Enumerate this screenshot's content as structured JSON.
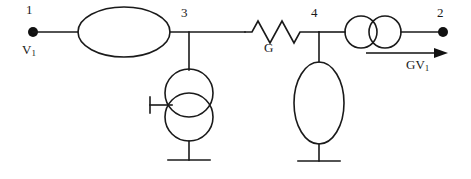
{
  "figure": {
    "type": "circuit-schematic",
    "title": "",
    "background_color": "#ffffff",
    "line_color": "#1a1a1a"
  },
  "nodes": {
    "node_1": "1",
    "node_2": "2",
    "node_3": "3",
    "node_4": "4"
  },
  "labels": {
    "input_voltage": "V",
    "input_voltage_subscript": "1",
    "conductance": "G",
    "dependent_source": "GV",
    "dependent_source_subscript": "1"
  },
  "components": [
    {
      "id": "source-left",
      "name": "left-ellipse-source",
      "symbol": "ellipse-horizontal",
      "between": [
        "1",
        "3"
      ]
    },
    {
      "id": "shunt-3",
      "name": "node-3-shunt-double-circle-source",
      "symbol": "double-circle-vertical-with-stub",
      "between": [
        "3",
        "ground"
      ]
    },
    {
      "id": "resistor-g",
      "name": "conductance-g",
      "symbol": "zigzag-resistor",
      "label": "G",
      "between": [
        "3",
        "4"
      ]
    },
    {
      "id": "shunt-4",
      "name": "node-4-shunt-ellipse",
      "symbol": "ellipse-vertical",
      "between": [
        "4",
        "ground"
      ]
    },
    {
      "id": "source-right",
      "name": "dependent-current-source",
      "symbol": "double-circle-horizontal",
      "label": "GV1",
      "between": [
        "4",
        "2"
      ]
    }
  ],
  "grounds": [
    {
      "id": "ground-3",
      "name": "ground-under-node-3"
    },
    {
      "id": "ground-4",
      "name": "ground-under-node-4"
    }
  ],
  "arrows": [
    {
      "id": "output-current-arrow",
      "name": "output-current-arrow",
      "label": "GV1",
      "direction": "right"
    }
  ]
}
